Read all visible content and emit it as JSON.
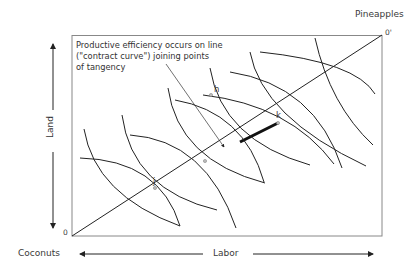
{
  "labels": {
    "top_right_good": "Pineapples",
    "bottom_left_good": "Coconuts",
    "origin": "0",
    "origin_prime": "0'",
    "x_axis": "Labor",
    "y_axis": "Land",
    "annotation_lines": [
      "Productive efficiency occurs on line",
      "(\"contract curve\") joining points",
      "of tangency"
    ],
    "points": {
      "h": "h",
      "j": "j",
      "k": "k"
    }
  },
  "colors": {
    "line": "#222222",
    "box": "#888888",
    "text": "#333333",
    "point": "#aaaaaa"
  }
}
